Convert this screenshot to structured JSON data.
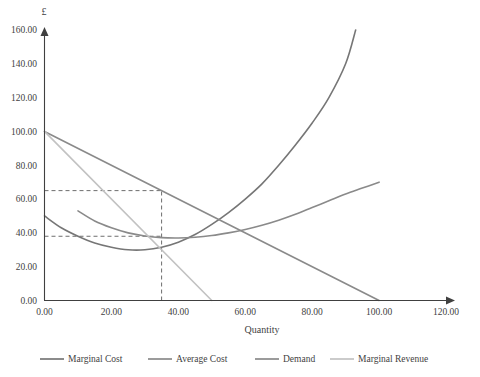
{
  "chart_data": {
    "type": "line",
    "title": "",
    "xlabel": "Quantity",
    "ylabel": "£",
    "xlim": [
      0,
      120
    ],
    "ylim": [
      0,
      160
    ],
    "xticks": [
      "0.00",
      "20.00",
      "40.00",
      "60.00",
      "80.00",
      "100.00",
      "120.00"
    ],
    "yticks": [
      "0.00",
      "20.00",
      "40.00",
      "60.00",
      "80.00",
      "100.00",
      "120.00",
      "140.00",
      "160.00"
    ],
    "xtick_values": [
      0,
      20,
      40,
      60,
      80,
      100,
      120
    ],
    "ytick_values": [
      0,
      20,
      40,
      60,
      80,
      100,
      120,
      140,
      160
    ],
    "grid": false,
    "legend_position": "bottom",
    "series": [
      {
        "name": "Marginal Cost",
        "color": "#767676",
        "shape": "u-curve",
        "points": [
          [
            0,
            50
          ],
          [
            5,
            43
          ],
          [
            10,
            38
          ],
          [
            15,
            34
          ],
          [
            20,
            31.5
          ],
          [
            25,
            30
          ],
          [
            30,
            30
          ],
          [
            35,
            31.5
          ],
          [
            40,
            34.5
          ],
          [
            45,
            39
          ],
          [
            50,
            45
          ],
          [
            55,
            52
          ],
          [
            60,
            60
          ],
          [
            65,
            69
          ],
          [
            70,
            80
          ],
          [
            75,
            92
          ],
          [
            80,
            105
          ],
          [
            85,
            120
          ],
          [
            90,
            140
          ],
          [
            93,
            160
          ]
        ]
      },
      {
        "name": "Average Cost",
        "color": "#8a8a8a",
        "shape": "u-curve",
        "points": [
          [
            10,
            53
          ],
          [
            15,
            47
          ],
          [
            20,
            43
          ],
          [
            25,
            40
          ],
          [
            30,
            38.2
          ],
          [
            35,
            37.2
          ],
          [
            40,
            37
          ],
          [
            45,
            37.4
          ],
          [
            50,
            38.4
          ],
          [
            55,
            40
          ],
          [
            60,
            42
          ],
          [
            65,
            44.5
          ],
          [
            70,
            47.5
          ],
          [
            75,
            51
          ],
          [
            80,
            55
          ],
          [
            85,
            59
          ],
          [
            90,
            63
          ],
          [
            95,
            66.5
          ],
          [
            100,
            70
          ]
        ]
      },
      {
        "name": "Demand",
        "color": "#8a8a8a",
        "shape": "line",
        "points": [
          [
            0,
            100
          ],
          [
            100,
            0
          ]
        ]
      },
      {
        "name": "Marginal Revenue",
        "color": "#c2c2c2",
        "shape": "line",
        "points": [
          [
            0,
            100
          ],
          [
            50,
            0
          ]
        ]
      }
    ],
    "guides": [
      {
        "name": "price-horizontal",
        "type": "horizontal",
        "value": 65,
        "from_x": 0,
        "to_x": 35
      },
      {
        "name": "cost-horizontal",
        "type": "horizontal",
        "value": 38,
        "from_x": 0,
        "to_x": 35
      },
      {
        "name": "quantity-vertical",
        "type": "vertical",
        "value": 35,
        "from_y": 0,
        "to_y": 65
      }
    ]
  },
  "legend": {
    "items": [
      {
        "label": "Marginal Cost",
        "color": "#767676"
      },
      {
        "label": "Average Cost",
        "color": "#8a8a8a"
      },
      {
        "label": "Demand",
        "color": "#8a8a8a"
      },
      {
        "label": "Marginal Revenue",
        "color": "#c2c2c2"
      }
    ]
  },
  "axis": {
    "y_symbol": "£",
    "x_title": "Quantity"
  }
}
